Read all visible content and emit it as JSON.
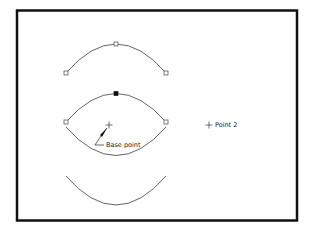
{
  "diagram": {
    "type": "cad-arc-copy-illustration",
    "frame": {
      "x": 17,
      "y": 10,
      "width": 280,
      "height": 210,
      "stroke": "#111111",
      "stroke_width": 2.5
    },
    "arcs": [
      {
        "name": "top-arc",
        "start": [
          66,
          73
        ],
        "control_mid": [
          116,
          44
        ],
        "end": [
          166,
          73
        ],
        "grips": "hollow",
        "color": "#555555"
      },
      {
        "name": "middle-upper-arc",
        "start": [
          66,
          122
        ],
        "control_mid": [
          116,
          93
        ],
        "end": [
          166,
          122
        ],
        "grips": "hollow-ends-filled-mid",
        "color": "#555555"
      },
      {
        "name": "middle-lower-arc",
        "start": [
          66,
          126
        ],
        "control_mid": [
          116,
          155
        ],
        "end": [
          166,
          126
        ],
        "color": "#555555"
      },
      {
        "name": "bottom-arc",
        "start": [
          66,
          176
        ],
        "control_mid": [
          116,
          205
        ],
        "end": [
          166,
          176
        ],
        "color": "#555555"
      }
    ],
    "labels": {
      "base_point": "Base point",
      "point_2": "Point 2"
    },
    "markers": {
      "base_point": [
        109,
        125
      ],
      "point_2": [
        209,
        125
      ]
    }
  }
}
